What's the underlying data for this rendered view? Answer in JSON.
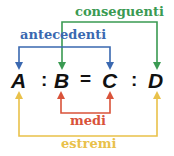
{
  "diagram": {
    "terms": [
      "A",
      "B",
      "C",
      "D"
    ],
    "operators": [
      ":",
      "=",
      ":"
    ],
    "labels": {
      "conseguenti": "conseguenti",
      "antecedenti": "antecedenti",
      "medi": "medi",
      "estremi": "estremi"
    },
    "colors": {
      "conseguenti": "#3a9a52",
      "antecedenti": "#3a68b0",
      "medi": "#d9533a",
      "estremi": "#e9c14a",
      "text": "#111111"
    }
  }
}
